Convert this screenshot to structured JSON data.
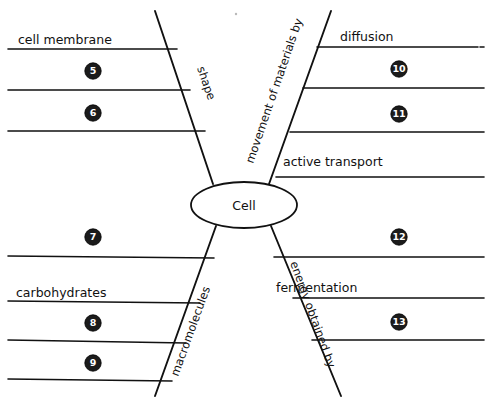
{
  "diagram": {
    "title_node": "Cell",
    "branches": [
      {
        "id": "shape",
        "label": "shape",
        "quadrant": "top-left"
      },
      {
        "id": "movement",
        "label": "movement of materials by",
        "quadrant": "top-right"
      },
      {
        "id": "macromolecules",
        "label": "macromolecules",
        "quadrant": "bottom-left"
      },
      {
        "id": "energy",
        "label": "energy obtained by",
        "quadrant": "bottom-right"
      }
    ],
    "labels": [
      {
        "id": "cell-membrane",
        "text": "cell membrane",
        "x": 18,
        "y": 44,
        "quadrant": "top-left"
      },
      {
        "id": "diffusion",
        "text": "diffusion",
        "x": 340,
        "y": 41,
        "quadrant": "top-right"
      },
      {
        "id": "active-transport",
        "text": "active transport",
        "x": 283,
        "y": 166,
        "quadrant": "top-right"
      },
      {
        "id": "carbohydrates",
        "text": "carbohydrates",
        "x": 16,
        "y": 297,
        "quadrant": "bottom-left"
      },
      {
        "id": "fermentation",
        "text": "fermentation",
        "x": 276,
        "y": 292,
        "quadrant": "bottom-right"
      }
    ],
    "markers": [
      {
        "number": "5",
        "x": 93,
        "y": 71,
        "quadrant": "top-left"
      },
      {
        "number": "6",
        "x": 93,
        "y": 113,
        "quadrant": "top-left"
      },
      {
        "number": "7",
        "x": 93,
        "y": 237,
        "quadrant": "bottom-left"
      },
      {
        "number": "8",
        "x": 93,
        "y": 323,
        "quadrant": "bottom-left"
      },
      {
        "number": "9",
        "x": 93,
        "y": 363,
        "quadrant": "bottom-left"
      },
      {
        "number": "10",
        "x": 399,
        "y": 69,
        "quadrant": "top-right"
      },
      {
        "number": "11",
        "x": 399,
        "y": 114,
        "quadrant": "top-right"
      },
      {
        "number": "12",
        "x": 399,
        "y": 237,
        "quadrant": "bottom-right"
      },
      {
        "number": "13",
        "x": 399,
        "y": 322,
        "quadrant": "bottom-right"
      }
    ],
    "answer_lines": [
      {
        "id": "tl-1",
        "x1": 8,
        "y1": 49,
        "x2": 177,
        "y2": 49
      },
      {
        "id": "tl-2",
        "x1": 8,
        "y1": 90,
        "x2": 190,
        "y2": 90
      },
      {
        "id": "tl-3",
        "x1": 8,
        "y1": 131,
        "x2": 205,
        "y2": 131
      },
      {
        "id": "tr-1",
        "x1": 317,
        "y1": 47,
        "x2": 484,
        "y2": 47
      },
      {
        "id": "tr-2",
        "x1": 303,
        "y1": 88,
        "x2": 484,
        "y2": 88
      },
      {
        "id": "tr-3",
        "x1": 290,
        "y1": 132,
        "x2": 484,
        "y2": 132
      },
      {
        "id": "tr-4",
        "x1": 276,
        "y1": 177,
        "x2": 484,
        "y2": 177
      },
      {
        "id": "bl-1",
        "x1": 8,
        "y1": 256,
        "x2": 214,
        "y2": 258
      },
      {
        "id": "bl-2",
        "x1": 8,
        "y1": 301,
        "x2": 200,
        "y2": 303
      },
      {
        "id": "bl-3",
        "x1": 8,
        "y1": 340,
        "x2": 186,
        "y2": 343
      },
      {
        "id": "bl-4",
        "x1": 8,
        "y1": 379,
        "x2": 172,
        "y2": 381
      },
      {
        "id": "br-1",
        "x1": 274,
        "y1": 257,
        "x2": 484,
        "y2": 257
      },
      {
        "id": "br-2",
        "x1": 293,
        "y1": 298,
        "x2": 484,
        "y2": 298
      },
      {
        "id": "br-3",
        "x1": 312,
        "y1": 340,
        "x2": 484,
        "y2": 340
      }
    ],
    "branch_lines": [
      {
        "id": "diag-tl",
        "x1": 155,
        "y1": 11,
        "x2": 213,
        "y2": 184
      },
      {
        "id": "diag-tr",
        "x1": 331,
        "y1": 11,
        "x2": 269,
        "y2": 184
      },
      {
        "id": "diag-bl",
        "x1": 155,
        "y1": 396,
        "x2": 216,
        "y2": 226
      },
      {
        "id": "diag-br",
        "x1": 341,
        "y1": 396,
        "x2": 271,
        "y2": 226
      }
    ],
    "center_ellipse": {
      "cx": 244,
      "cy": 205,
      "rx": 53,
      "ry": 23
    }
  }
}
